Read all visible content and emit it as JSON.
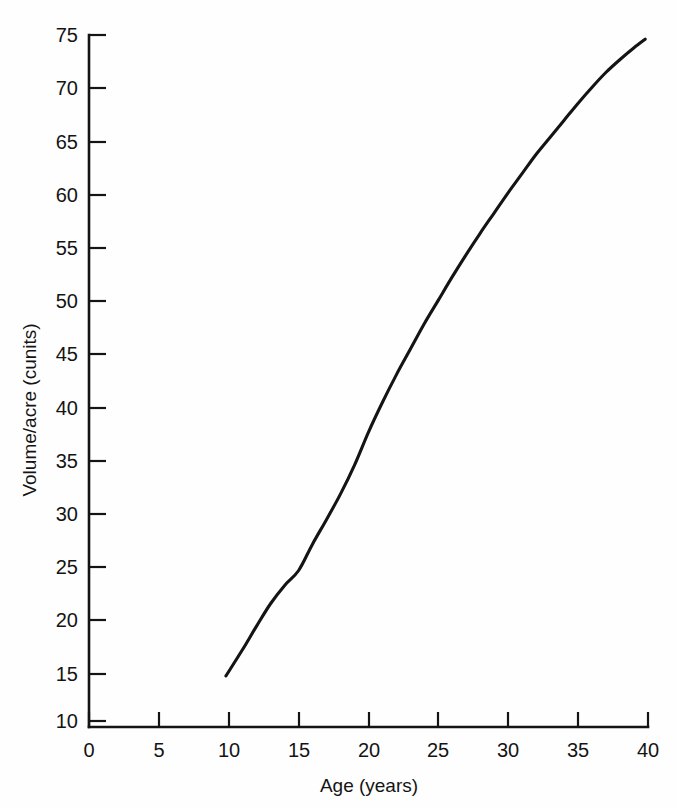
{
  "chart_data": {
    "type": "line",
    "title": "",
    "subtitle": "",
    "xlabel": "Age (years)",
    "ylabel": "Volume/acre (cunits)",
    "xlim": [
      0,
      40
    ],
    "ylim": [
      10,
      75
    ],
    "xticks": [
      0,
      5,
      10,
      15,
      20,
      25,
      30,
      35,
      40
    ],
    "xtick_labels": [
      "0",
      "5",
      "10",
      "15",
      "20",
      "25",
      "30",
      "35",
      "40"
    ],
    "yticks": [
      10,
      15,
      20,
      25,
      30,
      35,
      40,
      45,
      50,
      55,
      60,
      65,
      70,
      75
    ],
    "ytick_labels": [
      "10",
      "15",
      "20",
      "25",
      "30",
      "35",
      "40",
      "45",
      "50",
      "55",
      "60",
      "65",
      "70",
      "75"
    ],
    "grid": false,
    "legend": false,
    "legend_position": "none",
    "series": [
      {
        "name": "Volume per acre",
        "color": "#141414",
        "x": [
          9.8,
          11,
          12,
          13,
          14,
          15,
          16,
          17,
          18,
          19,
          20,
          21,
          22,
          23,
          24,
          25,
          26,
          27,
          28,
          29,
          30,
          31,
          32,
          33,
          34,
          35,
          36,
          37,
          38,
          39,
          39.8
        ],
        "values": [
          14.8,
          17.3,
          19.5,
          21.6,
          23.3,
          24.7,
          27.2,
          29.5,
          31.9,
          34.6,
          37.7,
          40.5,
          43.1,
          45.5,
          47.9,
          50.1,
          52.3,
          54.4,
          56.4,
          58.3,
          60.2,
          62.0,
          63.8,
          65.4,
          67.0,
          68.6,
          70.1,
          71.5,
          72.7,
          73.8,
          74.6
        ]
      }
    ],
    "annotations": []
  },
  "figure": {
    "background_color": "#fefefe",
    "axis_color": "#141414",
    "curve_color": "#141414"
  }
}
